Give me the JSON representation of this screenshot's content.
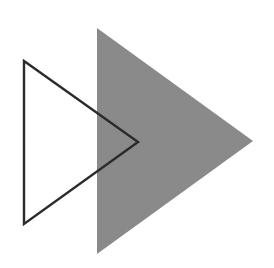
{
  "figure": {
    "title": "Two overlapping right-pointing triangles",
    "width": 274,
    "height": 268,
    "background_color": "#ffffff"
  },
  "shapes": [
    {
      "id": "gray-triangle",
      "name": "filled-triangle",
      "label": "Gray filled triangle",
      "kind": "triangle",
      "direction": "right-pointing",
      "fill_color": "#8a8a8a",
      "stroke_color": "none",
      "stroke_width": 0,
      "points": "97,28 253,141 97,254",
      "vertices": [
        {
          "x": 97,
          "y": 28
        },
        {
          "x": 253,
          "y": 141
        },
        {
          "x": 97,
          "y": 254
        }
      ]
    },
    {
      "id": "outline-triangle",
      "name": "outlined-triangle",
      "label": "Black outlined triangle",
      "kind": "triangle",
      "direction": "right-pointing",
      "fill_color": "none",
      "stroke_color": "#2b2b2b",
      "stroke_width": 2.4,
      "points": "24,61 138,142 24,224",
      "vertices": [
        {
          "x": 24,
          "y": 61
        },
        {
          "x": 138,
          "y": 142
        },
        {
          "x": 24,
          "y": 224
        }
      ]
    }
  ]
}
